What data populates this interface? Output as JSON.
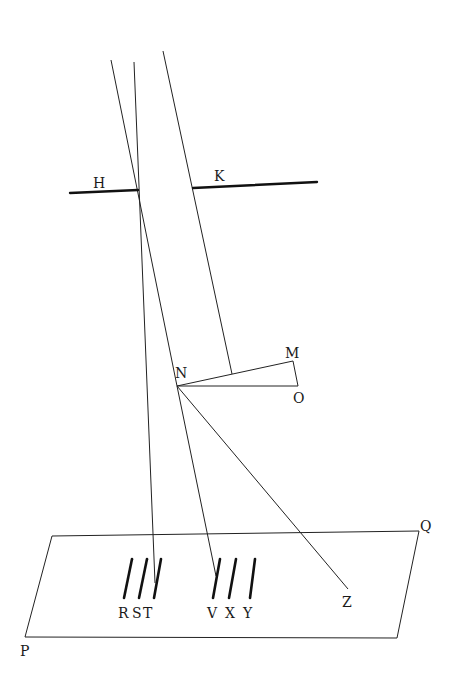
{
  "diagram": {
    "labels": {
      "H": "H",
      "K": "K",
      "M": "M",
      "N": "N",
      "O": "O",
      "P": "P",
      "Q": "Q",
      "R": "R",
      "S": "S",
      "T": "T",
      "V": "V",
      "X": "X",
      "Y": "Y",
      "Z": "Z"
    },
    "colors": {
      "line": "#222222",
      "background": "#ffffff"
    }
  }
}
